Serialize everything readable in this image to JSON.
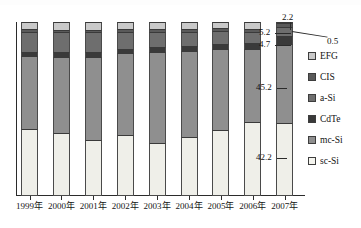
{
  "chart_data": {
    "type": "bar",
    "subtype": "stacked-percent",
    "title": "",
    "xlabel": "",
    "ylabel": "",
    "ylim": [
      0,
      100
    ],
    "grid": false,
    "legend_position": "right",
    "categories": [
      "1999年",
      "2000年",
      "2001年",
      "2002年",
      "2003年",
      "2004年",
      "2005年",
      "2006年",
      "2007年"
    ],
    "series": [
      {
        "name": "sc-Si",
        "color": "#efefe9",
        "values": [
          38.5,
          36.0,
          32.0,
          35.0,
          30.5,
          34.0,
          38.0,
          42.5,
          42.2
        ]
      },
      {
        "name": "mc-Si",
        "color": "#8f8f8f",
        "values": [
          42.0,
          44.0,
          48.0,
          47.0,
          52.5,
          49.5,
          46.5,
          42.0,
          45.2
        ]
      },
      {
        "name": "CdTe",
        "color": "#3a3a3a",
        "values": [
          2.0,
          2.5,
          2.5,
          2.5,
          2.5,
          2.5,
          3.0,
          3.5,
          4.7
        ]
      },
      {
        "name": "a-Si",
        "color": "#6e6e6e",
        "values": [
          12.0,
          11.5,
          11.5,
          10.0,
          9.0,
          8.5,
          7.5,
          6.5,
          5.2
        ]
      },
      {
        "name": "CIS",
        "color": "#5a5a5a",
        "values": [
          1.5,
          1.5,
          1.5,
          1.5,
          1.5,
          1.5,
          1.5,
          1.5,
          2.2
        ]
      },
      {
        "name": "EFG",
        "color": "#c9c9c9",
        "values": [
          4.0,
          4.5,
          4.5,
          4.0,
          4.0,
          4.0,
          3.5,
          4.0,
          0.5
        ]
      }
    ],
    "annotations": [
      {
        "label": "2.2",
        "series": "CIS",
        "category": "2007年"
      },
      {
        "label": "0.5",
        "series": "EFG",
        "category": "2007年"
      },
      {
        "label": "5.2",
        "series": "a-Si",
        "category": "2007年"
      },
      {
        "label": "4.7",
        "series": "CdTe",
        "category": "2007年"
      },
      {
        "label": "45.2",
        "series": "mc-Si",
        "category": "2007年"
      },
      {
        "label": "42.2",
        "series": "sc-Si",
        "category": "2007年"
      }
    ]
  },
  "legend": {
    "items": [
      {
        "label": "EFG",
        "color": "#c9c9c9"
      },
      {
        "label": "CIS",
        "color": "#5a5a5a"
      },
      {
        "label": "a-Si",
        "color": "#6e6e6e"
      },
      {
        "label": "CdTe",
        "color": "#3a3a3a"
      },
      {
        "label": "mc-Si",
        "color": "#8f8f8f"
      },
      {
        "label": "sc-Si",
        "color": "#f4f4ee"
      }
    ]
  },
  "axis": {
    "tick_labels": [
      "1999年",
      "2000年",
      "2001年",
      "2002年",
      "2003年",
      "2004年",
      "2005年",
      "2006年",
      "2007年"
    ]
  },
  "callouts": {
    "top_value": "2.2",
    "efg_value": "0.5",
    "asi_value": "5.2",
    "cdte_value": "4.7",
    "mcsi_value": "45.2",
    "scsi_value": "42.2"
  }
}
